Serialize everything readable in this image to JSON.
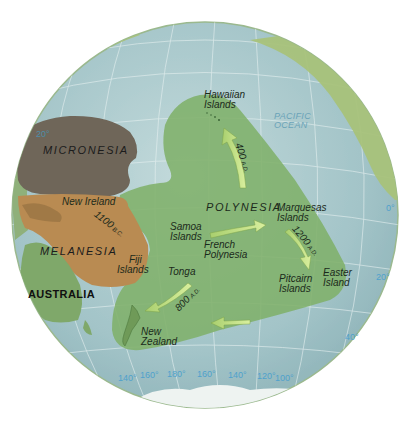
{
  "map": {
    "projection": "orthographic globe centered on the Pacific Ocean",
    "colors": {
      "ocean": "#a9c9cc",
      "land": "#a8c27a",
      "polynesia": "#7fb06a",
      "micronesia": "#6f6659",
      "melanesia": "#b98b52",
      "arrow": "#c9e38a",
      "graticule_label": "#4fa1cc",
      "ocean_label": "#6aa3b8"
    },
    "regions": {
      "micronesia": "MICRONESIA",
      "melanesia": "MELANESIA",
      "polynesia": "POLYNESIA"
    },
    "landmass": {
      "australia": "AUSTRALIA"
    },
    "ocean_label": {
      "line1": "PACIFIC",
      "line2": "OCEAN"
    },
    "places": {
      "hawaiian": {
        "line1": "Hawaiian",
        "line2": "Islands"
      },
      "new_ireland": "New Ireland",
      "fiji": {
        "line1": "Fiji",
        "line2": "Islands"
      },
      "samoa": {
        "line1": "Samoa",
        "line2": "Islands"
      },
      "french_polynesia": {
        "line1": "French",
        "line2": "Polynesia"
      },
      "marquesas": {
        "line1": "Marquesas",
        "line2": "Islands"
      },
      "tonga": "Tonga",
      "pitcairn": {
        "line1": "Pitcairn",
        "line2": "Islands"
      },
      "easter": {
        "line1": "Easter",
        "line2": "Island"
      },
      "new_zealand": {
        "line1": "New",
        "line2": "Zealand"
      }
    },
    "migration_dates": [
      {
        "year": "1100",
        "era": "B.C.",
        "route": "New Ireland to Fiji Islands"
      },
      {
        "year": "400",
        "era": "A.D.",
        "route": "to Hawaiian Islands"
      },
      {
        "year": "1200",
        "era": "A.D.",
        "route": "Marquesas Islands to Easter Island"
      },
      {
        "year": "800",
        "era": "A.D.",
        "route": "Tonga to New Zealand"
      }
    ],
    "longitude_labels": [
      "140°",
      "160°",
      "180°",
      "160°",
      "140°",
      "120°",
      "100°"
    ],
    "latitude_labels": {
      "left": "20°",
      "right": [
        "0°",
        "20°",
        "40°"
      ]
    }
  }
}
